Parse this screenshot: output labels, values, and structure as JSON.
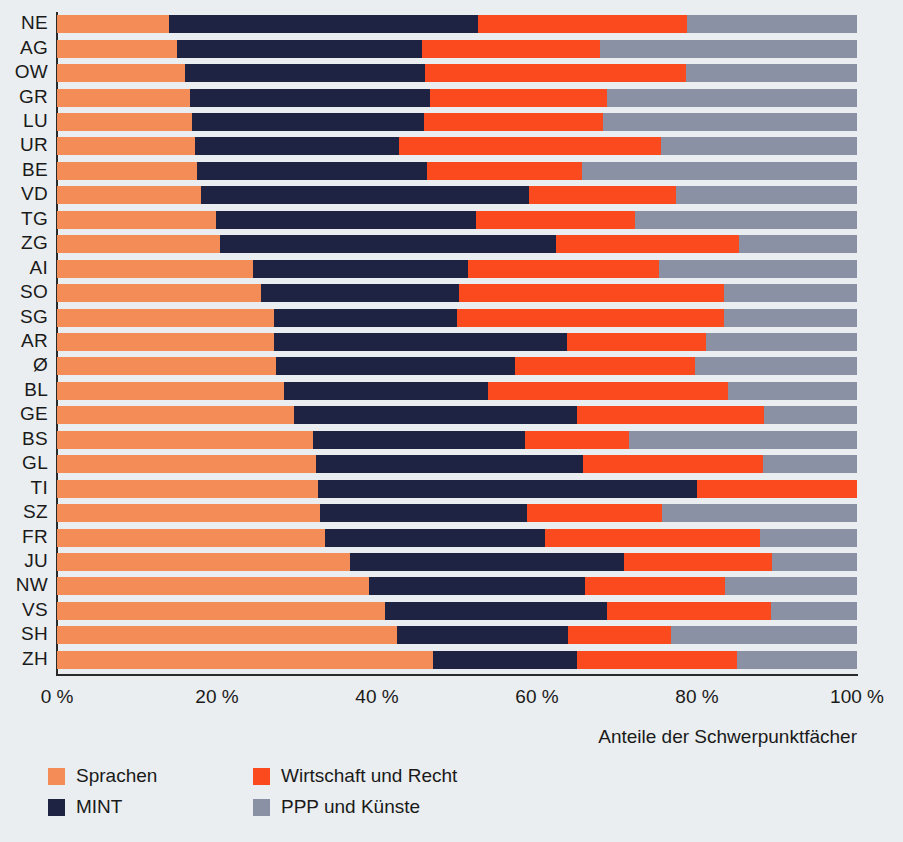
{
  "chart_data": {
    "type": "bar",
    "orientation": "horizontal",
    "stacked": true,
    "normalized_percent": true,
    "title": "",
    "subtitle": "",
    "xlabel": "Anteile der Schwerpunktfächer",
    "ylabel": "",
    "xlim": [
      0,
      100
    ],
    "xticks": [
      0,
      20,
      40,
      60,
      80,
      100
    ],
    "xtick_labels": [
      "0 %",
      "20 %",
      "40 %",
      "60 %",
      "80 %",
      "100 %"
    ],
    "grid": false,
    "legend_position": "bottom-left",
    "categories": [
      "NE",
      "AG",
      "OW",
      "GR",
      "LU",
      "UR",
      "BE",
      "VD",
      "TG",
      "ZG",
      "AI",
      "SO",
      "SG",
      "AR",
      "Ø",
      "BL",
      "GE",
      "BS",
      "GL",
      "TI",
      "SZ",
      "FR",
      "JU",
      "NW",
      "VS",
      "SH",
      "ZH"
    ],
    "series": [
      {
        "name": "Sprachen",
        "color": "#f48c58",
        "values": [
          14.0,
          15.0,
          16.0,
          16.6,
          16.9,
          17.3,
          17.5,
          18.0,
          19.9,
          20.4,
          24.5,
          25.5,
          27.1,
          27.1,
          27.4,
          28.4,
          29.6,
          32.0,
          32.4,
          32.6,
          32.9,
          33.5,
          36.6,
          39.0,
          41.0,
          42.5,
          47.0
        ]
      },
      {
        "name": "MINT",
        "color": "#1e2344",
        "values": [
          38.6,
          30.6,
          30.0,
          30.0,
          29.0,
          25.4,
          28.8,
          41.0,
          32.5,
          42.0,
          26.9,
          24.8,
          22.9,
          36.6,
          29.8,
          25.5,
          35.4,
          26.5,
          33.3,
          47.4,
          25.9,
          27.5,
          34.3,
          27.0,
          27.8,
          21.4,
          18.0
        ]
      },
      {
        "name": "Wirtschaft und Recht",
        "color": "#fa4a1e",
        "values": [
          26.1,
          22.3,
          32.6,
          22.1,
          22.4,
          32.8,
          19.3,
          18.4,
          19.8,
          22.9,
          23.9,
          33.1,
          33.4,
          17.4,
          22.5,
          30.0,
          23.4,
          13.0,
          22.6,
          20.0,
          16.8,
          26.9,
          18.5,
          17.5,
          20.4,
          12.9,
          20.0
        ]
      },
      {
        "name": "PPP und Künste",
        "color": "#8b91a4",
        "values": [
          21.3,
          32.1,
          21.4,
          31.3,
          31.7,
          24.5,
          34.4,
          22.6,
          27.8,
          14.7,
          24.7,
          16.6,
          16.6,
          18.9,
          20.3,
          16.1,
          11.6,
          28.5,
          11.7,
          0.0,
          24.4,
          12.1,
          10.6,
          16.5,
          10.8,
          23.2,
          15.0
        ]
      }
    ]
  },
  "axis": {
    "caption": "Anteile der Schwerpunktfächer",
    "tick_labels": [
      "0 %",
      "20 %",
      "40 %",
      "60 %",
      "80 %",
      "100 %"
    ],
    "tick_values": [
      0,
      20,
      40,
      60,
      80,
      100
    ]
  },
  "legend": {
    "items": [
      {
        "label": "Sprachen",
        "color": "#f48c58"
      },
      {
        "label": "Wirtschaft und Recht",
        "color": "#fa4a1e"
      },
      {
        "label": "MINT",
        "color": "#1e2344"
      },
      {
        "label": "PPP und Künste",
        "color": "#8b91a4"
      }
    ]
  },
  "colors": {
    "background": "#eaeef0",
    "axis": "#2a2a2a",
    "text": "#1a1a1a",
    "sprachen": "#f48c58",
    "mint": "#1e2344",
    "wirtschaft": "#fa4a1e",
    "ppp": "#8b91a4"
  }
}
